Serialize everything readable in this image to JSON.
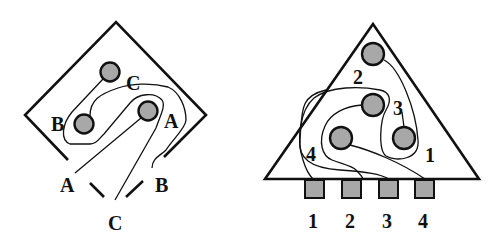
{
  "colors": {
    "pin_fill": "#a8a8a8",
    "pad_fill": "#a8a8a8",
    "line": "#111111",
    "background": "#ffffff"
  },
  "left_diagram": {
    "shape": "diamond",
    "pin_labels": {
      "c": "C",
      "b": "B",
      "a": "A"
    },
    "lead_labels": {
      "a": "A",
      "b": "B",
      "c": "C"
    }
  },
  "right_diagram": {
    "shape": "triangle",
    "pin_labels": {
      "p1": "1",
      "p2": "2",
      "p3": "3",
      "p4": "4"
    },
    "pad_labels": [
      "1",
      "2",
      "3",
      "4"
    ]
  }
}
